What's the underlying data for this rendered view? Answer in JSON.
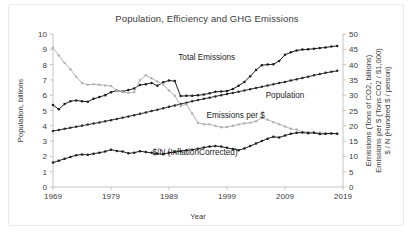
{
  "chart_data": {
    "type": "line",
    "title": "Population, Efficiency and GHG Emissions",
    "xlabel": "Year",
    "ylabel": "Population, billions",
    "ylabel_right_lines": [
      "Emissions (Tons of CO2, billions)",
      "Emissions per $ (Tons CO2 / $1,000)",
      "$ / N (Hundred $ / person)"
    ],
    "xlim": [
      1969,
      2019
    ],
    "ylim": [
      0,
      10
    ],
    "ylim_right": [
      0,
      50
    ],
    "xticks": [
      "1969",
      "1979",
      "1989",
      "1999",
      "2009",
      "2019"
    ],
    "xtick_values": [
      1969,
      1979,
      1989,
      1999,
      2009,
      2019
    ],
    "yticks": [
      "0",
      "1",
      "2",
      "3",
      "4",
      "5",
      "6",
      "7",
      "8",
      "9",
      "10"
    ],
    "ytick_values": [
      0,
      1,
      2,
      3,
      4,
      5,
      6,
      7,
      8,
      9,
      10
    ],
    "yticks_right": [
      "0",
      "5",
      "10",
      "15",
      "20",
      "25",
      "30",
      "35",
      "40",
      "45",
      "50"
    ],
    "ytick_right_values": [
      0,
      5,
      10,
      15,
      20,
      25,
      30,
      35,
      40,
      45,
      50
    ],
    "grid": false,
    "legend_position": "inline-annotations",
    "x": [
      1969,
      1970,
      1971,
      1972,
      1973,
      1974,
      1975,
      1976,
      1977,
      1978,
      1979,
      1980,
      1981,
      1982,
      1983,
      1984,
      1985,
      1986,
      1987,
      1988,
      1989,
      1990,
      1991,
      1992,
      1993,
      1994,
      1995,
      1996,
      1997,
      1998,
      1999,
      2000,
      2001,
      2002,
      2003,
      2004,
      2005,
      2006,
      2007,
      2008,
      2009,
      2010,
      2011,
      2012,
      2013,
      2014,
      2015,
      2016,
      2017,
      2018
    ],
    "series": [
      {
        "name": "Total Emissions",
        "label": "Total Emissions",
        "color": "#1d1d1d",
        "axis": "right",
        "unit": "Tons of CO2, billions",
        "values": [
          26.8,
          25.4,
          27.1,
          28.0,
          28.3,
          28.0,
          27.9,
          28.8,
          29.4,
          30.0,
          31.0,
          31.5,
          31.2,
          31.7,
          32.2,
          33.3,
          33.6,
          34.0,
          33.1,
          34.2,
          34.8,
          34.6,
          29.7,
          29.8,
          29.8,
          30.0,
          30.2,
          30.6,
          31.1,
          31.2,
          31.4,
          32.0,
          33.1,
          34.3,
          36.2,
          38.2,
          39.8,
          40.0,
          40.1,
          41.2,
          43.2,
          44.0,
          44.6,
          44.9,
          45.0,
          45.2,
          45.4,
          45.6,
          45.9,
          46.1
        ]
      },
      {
        "name": "Population",
        "label": "Population",
        "color": "#2b2b2b",
        "axis": "left",
        "unit": "billions",
        "values": [
          3.66,
          3.73,
          3.8,
          3.87,
          3.94,
          4.01,
          4.08,
          4.15,
          4.22,
          4.29,
          4.37,
          4.45,
          4.53,
          4.61,
          4.69,
          4.78,
          4.87,
          4.96,
          5.05,
          5.14,
          5.24,
          5.33,
          5.42,
          5.51,
          5.6,
          5.68,
          5.76,
          5.84,
          5.92,
          6.0,
          6.08,
          6.15,
          6.23,
          6.31,
          6.39,
          6.47,
          6.55,
          6.63,
          6.71,
          6.79,
          6.87,
          6.96,
          7.04,
          7.13,
          7.21,
          7.3,
          7.38,
          7.46,
          7.53,
          7.59
        ]
      },
      {
        "name": "Emissions per $",
        "label": "Emissions per $",
        "color": "#b3b3b3",
        "axis": "right",
        "unit": "Tons CO2 / $1,000",
        "values": [
          45.5,
          43.0,
          40.5,
          38.5,
          36.0,
          34.0,
          33.4,
          33.6,
          33.4,
          33.2,
          33.0,
          31.5,
          31.0,
          30.8,
          31.0,
          35.0,
          36.5,
          35.5,
          34.5,
          33.5,
          31.5,
          29.8,
          26.5,
          27.0,
          24.0,
          21.0,
          20.5,
          20.5,
          20.0,
          19.5,
          19.6,
          20.0,
          20.4,
          20.8,
          21.0,
          21.5,
          22.6,
          22.0,
          21.2,
          20.5,
          19.8,
          19.0,
          18.8,
          18.0,
          18.0,
          17.8,
          17.8,
          17.5,
          17.5,
          17.4
        ]
      },
      {
        "name": "$/N (InflationCorrected)",
        "label": "$/N (InflationCorrected)",
        "color": "#1d1d1d",
        "axis": "right",
        "unit": "Hundred $ / person",
        "values": [
          8.0,
          8.6,
          9.2,
          9.8,
          10.4,
          10.6,
          10.5,
          10.9,
          11.2,
          11.6,
          12.2,
          11.8,
          11.6,
          11.0,
          11.2,
          11.7,
          11.4,
          11.2,
          10.9,
          10.7,
          11.2,
          11.4,
          11.7,
          12.0,
          12.2,
          12.5,
          12.9,
          13.2,
          13.4,
          13.2,
          12.8,
          12.4,
          12.0,
          12.6,
          13.4,
          14.2,
          15.0,
          15.8,
          16.4,
          16.2,
          16.8,
          17.4,
          17.7,
          17.8,
          17.6,
          17.7,
          17.3,
          17.4,
          17.5,
          17.4
        ]
      }
    ],
    "annotations": [
      {
        "text": "Total Emissions",
        "x_px": 0.53,
        "y_px": 0.17
      },
      {
        "text": "Population",
        "x_px": 0.8,
        "y_px": 0.42
      },
      {
        "text": "Emissions per $",
        "x_px": 0.63,
        "y_px": 0.55
      },
      {
        "text": "$/N (InflationCorrected)",
        "x_px": 0.49,
        "y_px": 0.79
      }
    ]
  }
}
